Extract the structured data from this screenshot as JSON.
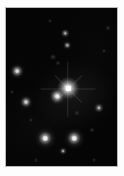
{
  "figure": {
    "kind": "astronomical-plate-image",
    "caption": "",
    "frame": {
      "mat_color": "#b9b9b9",
      "page_color": "#fdfdfd",
      "sky_color": "#050505",
      "star_color": "#ffffff",
      "plate_left": 6,
      "plate_top": 8,
      "plate_width": 111,
      "plate_height": 158
    }
  },
  "chart_data": {
    "type": "scatter",
    "title": "",
    "subtitle": "",
    "xlabel": "",
    "ylabel": "",
    "grid": false,
    "legend": "none",
    "xlim": [
      0,
      111
    ],
    "ylim": [
      0,
      158
    ],
    "series": [
      {
        "name": "stars",
        "points": [
          {
            "id": "star-primary",
            "label": "primary",
            "x": 62,
            "y": 80,
            "brightness": 1.0,
            "size": 21,
            "core": 5.0,
            "class": "bright",
            "spikes": true
          },
          {
            "id": "star-companion",
            "label": "companion",
            "x": 51,
            "y": 88,
            "brightness": 0.78,
            "size": 13,
            "core": 4.0,
            "class": "bright",
            "spikes": false
          },
          {
            "id": "star-lower-left",
            "label": "lower-left",
            "x": 39,
            "y": 130,
            "brightness": 0.82,
            "size": 13,
            "core": 4.2,
            "class": "bright",
            "spikes": false
          },
          {
            "id": "star-lower-right",
            "label": "lower-right",
            "x": 68,
            "y": 130,
            "brightness": 0.8,
            "size": 13,
            "core": 4.2,
            "class": "bright",
            "spikes": false
          },
          {
            "id": "star-west",
            "label": "west",
            "x": 11,
            "y": 63,
            "brightness": 0.7,
            "size": 11,
            "core": 3.4,
            "class": "bright",
            "spikes": false
          },
          {
            "id": "star-west-lower",
            "label": "west-lower",
            "x": 20,
            "y": 94,
            "brightness": 0.62,
            "size": 10,
            "core": 3.0,
            "class": "bright",
            "spikes": false
          },
          {
            "id": "star-east",
            "label": "east",
            "x": 93,
            "y": 100,
            "brightness": 0.5,
            "size": 8,
            "core": 2.4,
            "class": "faint",
            "spikes": false
          },
          {
            "id": "star-north-a",
            "label": "north-chain-upper",
            "x": 59,
            "y": 25,
            "brightness": 0.46,
            "size": 7,
            "core": 2.2,
            "class": "faint",
            "spikes": false
          },
          {
            "id": "star-north-b",
            "label": "north-chain-lower",
            "x": 61,
            "y": 37,
            "brightness": 0.42,
            "size": 7,
            "core": 2.0,
            "class": "faint",
            "spikes": false
          },
          {
            "id": "star-south",
            "label": "south",
            "x": 57,
            "y": 143,
            "brightness": 0.34,
            "size": 6,
            "core": 1.8,
            "class": "faint",
            "spikes": false
          },
          {
            "id": "star-nw-smudge",
            "label": "nw-smudge",
            "x": 47,
            "y": 49,
            "brightness": 0.22,
            "size": 6,
            "core": 0,
            "class": "vfaint",
            "spikes": false
          },
          {
            "id": "star-mid-smudge",
            "label": "mid-smudge",
            "x": 52,
            "y": 55,
            "brightness": 0.2,
            "size": 5,
            "core": 0,
            "class": "vfaint",
            "spikes": false
          },
          {
            "id": "star-ne-faint",
            "label": "ne-faint",
            "x": 102,
            "y": 20,
            "brightness": 0.18,
            "size": 5,
            "core": 0,
            "class": "vfaint",
            "spikes": false
          },
          {
            "id": "star-e-upper",
            "label": "east-upper",
            "x": 98,
            "y": 43,
            "brightness": 0.15,
            "size": 4,
            "core": 0,
            "class": "vfaint",
            "spikes": false
          },
          {
            "id": "star-w-faint",
            "label": "west-faint",
            "x": 25,
            "y": 112,
            "brightness": 0.14,
            "size": 4,
            "core": 0,
            "class": "vfaint",
            "spikes": false
          },
          {
            "id": "star-se-faint",
            "label": "se-faint",
            "x": 86,
            "y": 122,
            "brightness": 0.16,
            "size": 5,
            "core": 0,
            "class": "vfaint",
            "spikes": false
          },
          {
            "id": "star-s-edge",
            "label": "south-edge",
            "x": 88,
            "y": 152,
            "brightness": 0.14,
            "size": 4,
            "core": 0,
            "class": "vfaint",
            "spikes": false
          },
          {
            "id": "star-sw-edge",
            "label": "southwest-edge",
            "x": 30,
            "y": 152,
            "brightness": 0.12,
            "size": 4,
            "core": 0,
            "class": "vfaint",
            "spikes": false
          },
          {
            "id": "star-n-edge",
            "label": "north-edge",
            "x": 44,
            "y": 13,
            "brightness": 0.1,
            "size": 4,
            "core": 0,
            "class": "vfaint",
            "spikes": false
          },
          {
            "id": "star-center-faint",
            "label": "center-faint",
            "x": 71,
            "y": 105,
            "brightness": 0.13,
            "size": 5,
            "core": 0,
            "class": "vfaint",
            "spikes": false
          },
          {
            "id": "star-left-edge",
            "label": "left-edge",
            "x": 6,
            "y": 84,
            "brightness": 0.12,
            "size": 4,
            "core": 0,
            "class": "vfaint",
            "spikes": false
          }
        ]
      }
    ]
  }
}
